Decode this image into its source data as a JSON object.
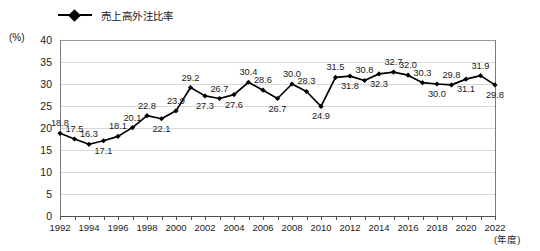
{
  "chart_data": {
    "type": "line",
    "title": "",
    "xlabel": "(年度)",
    "ylabel": "(%)",
    "ylim": [
      0,
      40
    ],
    "ytick_step": 5,
    "yticks": [
      "40",
      "35",
      "30",
      "25",
      "20",
      "15",
      "10",
      "5",
      "0"
    ],
    "grid": true,
    "legend_position": "top-left",
    "legend": [
      "売上高外注比率"
    ],
    "series": [
      {
        "name": "売上高外注比率",
        "color": "#000000",
        "marker": "diamond",
        "values": [
          18.8,
          17.5,
          16.3,
          17.1,
          18.1,
          20.1,
          22.8,
          22.1,
          23.9,
          29.2,
          27.3,
          26.7,
          27.6,
          30.4,
          28.6,
          26.7,
          30.0,
          28.3,
          24.9,
          31.5,
          31.8,
          30.8,
          32.3,
          32.7,
          32.0,
          30.3,
          30.0,
          29.8,
          31.1,
          31.9,
          29.8
        ]
      }
    ],
    "x": [
      1992,
      1993,
      1994,
      1995,
      1996,
      1997,
      1998,
      1999,
      2000,
      2001,
      2002,
      2003,
      2004,
      2005,
      2006,
      2007,
      2008,
      2009,
      2010,
      2011,
      2012,
      2013,
      2014,
      2015,
      2016,
      2017,
      2018,
      2019,
      2020,
      2021,
      2022
    ],
    "xtick_labels": [
      "1992",
      "",
      "1994",
      "",
      "1996",
      "",
      "1998",
      "",
      "2000",
      "",
      "2002",
      "",
      "2004",
      "",
      "2006",
      "",
      "2008",
      "",
      "2010",
      "",
      "2012",
      "",
      "2014",
      "",
      "2016",
      "",
      "2018",
      "",
      "2020",
      "",
      "2022"
    ],
    "point_labels": [
      "18.8",
      "17.5",
      "16.3",
      "17.1",
      "18.1",
      "20.1",
      "22.8",
      "22.1",
      "23.9",
      "29.2",
      "27.3",
      "26.7",
      "27.6",
      "30.4",
      "28.6",
      "26.7",
      "30.0",
      "28.3",
      "24.9",
      "31.5",
      "31.8",
      "30.8",
      "32.3",
      "32.7",
      "32.0",
      "30.3",
      "30.0",
      "29.8",
      "31.1",
      "31.9",
      "29.8"
    ],
    "label_positions": [
      "above",
      "above",
      "above",
      "below",
      "above",
      "above",
      "above",
      "below",
      "above",
      "above",
      "below",
      "above",
      "below",
      "above",
      "above",
      "below",
      "above",
      "above",
      "below",
      "above",
      "below",
      "above",
      "below",
      "above",
      "above",
      "above",
      "below",
      "above",
      "below",
      "above",
      "below"
    ]
  },
  "axes": {
    "y_unit": "(%)",
    "x_unit": "(年度)"
  }
}
